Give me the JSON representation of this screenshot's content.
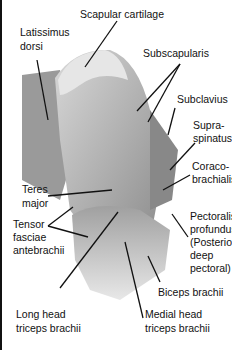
{
  "labels": {
    "scapular_cartilage": "Scapular cartilage",
    "latissimus_1": "Latissimus",
    "latissimus_2": "dorsi",
    "subscapularis": "Subscapularis",
    "subclavius": "Subclavius",
    "supraspinatus_1": "Supra-",
    "supraspinatus_2": "spinatus",
    "coraco_1": "Coraco-",
    "coraco_2": "brachialis",
    "teres_1": "Teres",
    "teres_2": "major",
    "tensor_1": "Tensor",
    "tensor_2": "fasciae",
    "tensor_3": "antebrachii",
    "pectoral_1": "Pectoralis",
    "pectoral_2": "profundus",
    "pectoral_3": "(Posterior",
    "pectoral_4": "deep",
    "pectoral_5": "pectoral)",
    "biceps": "Biceps brachii",
    "long_head_1": "Long head",
    "long_head_2": "triceps brachii",
    "medial_head_1": "Medial head",
    "medial_head_2": "triceps brachii"
  }
}
